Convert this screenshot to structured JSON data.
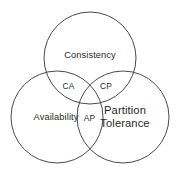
{
  "diagram": {
    "type": "venn-3-set",
    "background_color": "#ffffff",
    "stroke_color": "#4a4a4a",
    "text_color": "#2a2a2a",
    "sets": [
      {
        "id": "consistency",
        "label": "Consistency",
        "position": "top",
        "center_x": 90,
        "center_y": 58,
        "radius": 46
      },
      {
        "id": "availability",
        "label": "Availability",
        "position": "bottom-left",
        "center_x": 57,
        "center_y": 117,
        "radius": 46
      },
      {
        "id": "partition-tolerance",
        "label_line1": "Partition",
        "label_line2": "Tolerance",
        "position": "bottom-right",
        "center_x": 123,
        "center_y": 117,
        "radius": 46
      }
    ],
    "intersections": [
      {
        "id": "ca",
        "label": "CA",
        "between": "Consistency + Availability",
        "x": 68.5,
        "y": 87
      },
      {
        "id": "cp",
        "label": "CP",
        "between": "Consistency + Partition Tolerance",
        "x": 106,
        "y": 87
      },
      {
        "id": "ap",
        "label": "AP",
        "between": "Availability + Partition Tolerance",
        "x": 89.5,
        "y": 119
      }
    ]
  }
}
